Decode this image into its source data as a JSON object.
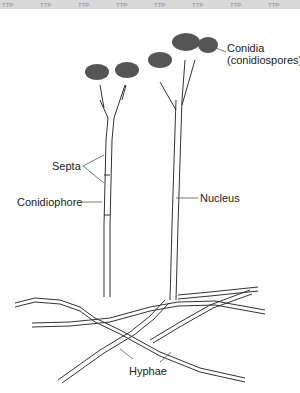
{
  "figure": {
    "top_band_motif": "ꟸꟸꟸ",
    "labels": {
      "conidia": "Conidia",
      "conidia_alt": "(conidiospores)",
      "septa": "Septa",
      "conidiophore": "Conidiophore",
      "nucleus": "Nucleus",
      "hyphae": "Hyphae"
    }
  }
}
